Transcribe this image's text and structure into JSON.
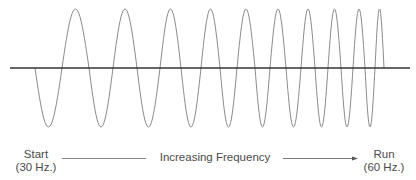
{
  "diagram": {
    "waveform": {
      "zero_crossings_x": [
        35,
        62,
        89,
        113,
        137,
        160,
        181,
        201,
        220,
        237,
        255,
        270,
        286,
        301,
        315,
        328,
        341,
        353,
        365,
        375,
        384
      ],
      "first_half_direction": "down",
      "axis_y": 68,
      "peak_y": 9,
      "trough_y": 127,
      "axis_start_x": 10,
      "axis_end_x": 410,
      "cycles": 10
    },
    "colors": {
      "wave": "#8a8a8a",
      "axis": "#333333",
      "text": "#4a4a4a",
      "arrow": "#555555"
    }
  },
  "labels": {
    "start": {
      "line1": "Start",
      "line2": "(30 Hz.)"
    },
    "middle": "Increasing Frequency",
    "end": {
      "line1": "Run",
      "line2": "(60 Hz.)"
    }
  }
}
